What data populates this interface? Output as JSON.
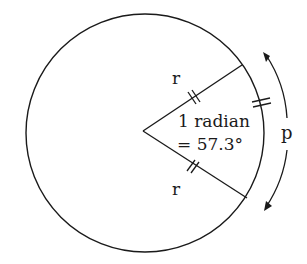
{
  "diagram": {
    "labels": {
      "radius_upper": "r",
      "radius_lower": "r",
      "angle_line1": "1 radian",
      "angle_line2": "= 57.3°",
      "arc": "p"
    },
    "colors": {
      "stroke": "#1a1a1a",
      "background": "#ffffff"
    }
  }
}
